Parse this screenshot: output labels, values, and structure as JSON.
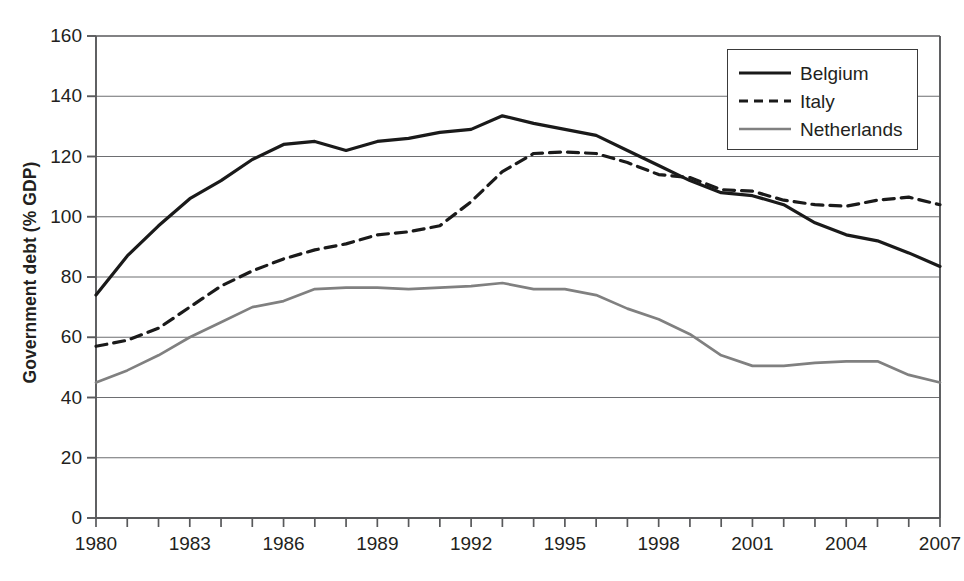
{
  "chart_data": {
    "type": "line",
    "title": "",
    "xlabel": "",
    "ylabel": "Government debt (% GDP)",
    "xlim": [
      1980,
      2007
    ],
    "ylim": [
      0,
      160
    ],
    "grid": true,
    "legend_position": "top-right",
    "y_ticks": [
      160,
      140,
      120,
      100,
      80,
      60,
      40,
      20,
      0
    ],
    "x_ticks": [
      1980,
      1981,
      1982,
      1983,
      1984,
      1985,
      1986,
      1987,
      1988,
      1989,
      1990,
      1991,
      1992,
      1993,
      1994,
      1995,
      1996,
      1997,
      1998,
      1999,
      2000,
      2001,
      2002,
      2003,
      2004,
      2005,
      2006,
      2007
    ],
    "x_tick_labels": [
      "1980",
      "",
      "",
      "1983",
      "",
      "",
      "1986",
      "",
      "",
      "1989",
      "",
      "",
      "1992",
      "",
      "",
      "1995",
      "",
      "",
      "1998",
      "",
      "",
      "2001",
      "",
      "",
      "2004",
      "",
      "",
      "2007"
    ],
    "x": [
      1980,
      1981,
      1982,
      1983,
      1984,
      1985,
      1986,
      1987,
      1988,
      1989,
      1990,
      1991,
      1992,
      1993,
      1994,
      1995,
      1996,
      1997,
      1998,
      1999,
      2000,
      2001,
      2002,
      2003,
      2004,
      2005,
      2006,
      2007
    ],
    "series": [
      {
        "name": "Belgium",
        "style": "solid",
        "color": "#1a1a1a",
        "values": [
          74,
          87,
          97,
          106,
          112,
          119,
          124,
          125,
          122,
          125,
          126,
          128,
          129,
          133.5,
          131,
          129,
          127,
          122,
          117,
          112,
          108,
          107,
          104,
          98,
          94,
          92,
          88,
          83.5
        ]
      },
      {
        "name": "Italy",
        "style": "dashed",
        "color": "#1a1a1a",
        "values": [
          57,
          59,
          63,
          70,
          77,
          82,
          86,
          89,
          91,
          94,
          95,
          97,
          105,
          115,
          121,
          121.5,
          121,
          118,
          114,
          113,
          109,
          108.5,
          105.5,
          104,
          103.5,
          105.5,
          106.5,
          104
        ]
      },
      {
        "name": "Netherlands",
        "style": "solid",
        "color": "#808080",
        "values": [
          45,
          49,
          54,
          60,
          65,
          70,
          72,
          76,
          76.5,
          76.5,
          76,
          76.5,
          77,
          78,
          76,
          76,
          74,
          69.5,
          66,
          61,
          54,
          50.5,
          50.5,
          51.5,
          52,
          52,
          47.5,
          45
        ]
      }
    ],
    "legend": [
      {
        "label": "Belgium",
        "style": "solid",
        "color": "#1a1a1a",
        "width": 3.2
      },
      {
        "label": "Italy",
        "style": "dashed",
        "color": "#1a1a1a",
        "width": 3.2
      },
      {
        "label": "Netherlands",
        "style": "solid",
        "color": "#808080",
        "width": 2.6
      }
    ]
  }
}
